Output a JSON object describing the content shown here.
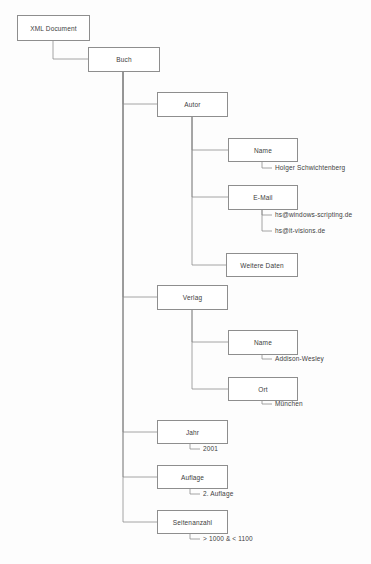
{
  "diagram": {
    "type": "tree",
    "line_color": "#8e8e8e",
    "box_fill": "#ffffff",
    "text_color": "#3d3d3d",
    "nodes": [
      {
        "id": "root",
        "label": "XML Document",
        "kind": "element",
        "x": 17,
        "y": 15,
        "w": 73,
        "h": 26
      },
      {
        "id": "buch",
        "label": "Buch",
        "kind": "element",
        "x": 88,
        "y": 47,
        "w": 72,
        "h": 25
      },
      {
        "id": "autor",
        "label": "Autor",
        "kind": "element",
        "x": 157,
        "y": 92,
        "w": 71,
        "h": 25
      },
      {
        "id": "autor_name",
        "label": "Name",
        "kind": "element",
        "x": 228,
        "y": 138,
        "w": 70,
        "h": 24
      },
      {
        "id": "email",
        "label": "E-Mail",
        "kind": "element",
        "x": 228,
        "y": 185,
        "w": 70,
        "h": 25
      },
      {
        "id": "weitere",
        "label": "Weitere Daten",
        "kind": "element",
        "x": 226,
        "y": 253,
        "w": 72,
        "h": 24
      },
      {
        "id": "verlag",
        "label": "Verlag",
        "kind": "element",
        "x": 157,
        "y": 285,
        "w": 71,
        "h": 25
      },
      {
        "id": "verlag_name",
        "label": "Name",
        "kind": "element",
        "x": 228,
        "y": 330,
        "w": 70,
        "h": 25
      },
      {
        "id": "ort",
        "label": "Ort",
        "kind": "element",
        "x": 228,
        "y": 377,
        "w": 70,
        "h": 24
      },
      {
        "id": "jahr",
        "label": "Jahr",
        "kind": "element",
        "x": 157,
        "y": 420,
        "w": 71,
        "h": 24
      },
      {
        "id": "auflage",
        "label": "Auflage",
        "kind": "element",
        "x": 157,
        "y": 465,
        "w": 71,
        "h": 24
      },
      {
        "id": "seiten",
        "label": "Seitenanzahl",
        "kind": "element",
        "x": 157,
        "y": 510,
        "w": 71,
        "h": 24
      }
    ],
    "leaves": [
      {
        "id": "v_autor_name",
        "label": "Holger Schwichtenberg",
        "parent": "autor_name",
        "x": 275,
        "y": 168
      },
      {
        "id": "v_email_1",
        "label": "hs@windows-scripting.de",
        "parent": "email",
        "x": 275,
        "y": 215
      },
      {
        "id": "v_email_2",
        "label": "hs@it-visions.de",
        "parent": "email",
        "x": 275,
        "y": 231
      },
      {
        "id": "v_verlag_name",
        "label": "Addison-Wesley",
        "parent": "verlag_name",
        "x": 275,
        "y": 359
      },
      {
        "id": "v_ort",
        "label": "München",
        "parent": "ort",
        "x": 275,
        "y": 404
      },
      {
        "id": "v_jahr",
        "label": "2001",
        "parent": "jahr",
        "x": 203,
        "y": 449
      },
      {
        "id": "v_auflage",
        "label": "2. Auflage",
        "parent": "auflage",
        "x": 203,
        "y": 494
      },
      {
        "id": "v_seiten",
        "label": "> 1000 & < 1100",
        "parent": "seiten",
        "x": 203,
        "y": 539
      }
    ],
    "edges": [
      {
        "from": "root",
        "to": "buch",
        "path": "M 53,41 L 53,59 L 88,59"
      },
      {
        "from": "buch",
        "to": "autor",
        "path": "M 123,72 L 123,104 L 157,104"
      },
      {
        "from": "buch",
        "to": "verlag",
        "path": "M 123,72 L 123,297 L 157,297"
      },
      {
        "from": "buch",
        "to": "jahr",
        "path": "M 123,72 L 123,432 L 157,432"
      },
      {
        "from": "buch",
        "to": "auflage",
        "path": "M 123,72 L 123,477 L 157,477"
      },
      {
        "from": "buch",
        "to": "seiten",
        "path": "M 123,72 L 123,522 L 157,522"
      },
      {
        "from": "autor",
        "to": "autor_name",
        "path": "M 192,117 L 192,150 L 228,150"
      },
      {
        "from": "autor",
        "to": "email",
        "path": "M 192,117 L 192,197 L 228,197"
      },
      {
        "from": "autor",
        "to": "weitere",
        "path": "M 192,117 L 192,265 L 226,265"
      },
      {
        "from": "autor_name",
        "to": "v_autor_name",
        "path": "M 262,162 L 262,168 L 272,168"
      },
      {
        "from": "email",
        "to": "v_email_1",
        "path": "M 262,210 L 262,215 L 272,215"
      },
      {
        "from": "email",
        "to": "v_email_2",
        "path": "M 262,210 L 262,231 L 272,231"
      },
      {
        "from": "verlag",
        "to": "verlag_name",
        "path": "M 192,310 L 192,342 L 228,342"
      },
      {
        "from": "verlag",
        "to": "ort",
        "path": "M 192,310 L 192,389 L 228,389"
      },
      {
        "from": "verlag_name",
        "to": "v_verlag_name",
        "path": "M 262,355 L 262,359 L 272,359"
      },
      {
        "from": "ort",
        "to": "v_ort",
        "path": "M 262,401 L 262,404 L 272,404"
      },
      {
        "from": "jahr",
        "to": "v_jahr",
        "path": "M 190,444 L 190,449 L 200,449"
      },
      {
        "from": "auflage",
        "to": "v_auflage",
        "path": "M 190,489 L 190,494 L 200,494"
      },
      {
        "from": "seiten",
        "to": "v_seiten",
        "path": "M 190,534 L 190,539 L 200,539"
      }
    ]
  }
}
